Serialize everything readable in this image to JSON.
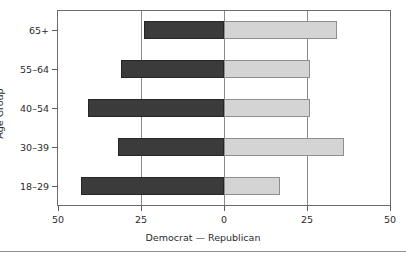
{
  "chart_data": {
    "type": "bar",
    "title": "",
    "subtitle": "",
    "orientation": "horizontal",
    "style": "diverging-population-pyramid",
    "xlabel": "Democrat  —  Republican",
    "ylabel": "Age Group",
    "categories": [
      "18–29",
      "30–39",
      "40–54",
      "55–64",
      "65+"
    ],
    "category_order_top_to_bottom": [
      "65+",
      "55–64",
      "40–54",
      "30–39",
      "18–29"
    ],
    "series": [
      {
        "name": "Democrat",
        "side": "left",
        "color": "#3b3b3b",
        "values": [
          43,
          32,
          41,
          31,
          24
        ]
      },
      {
        "name": "Republican",
        "side": "right",
        "color": "#d4d4d4",
        "values": [
          17,
          36,
          26,
          26,
          34
        ]
      }
    ],
    "xlim": [
      -50,
      50
    ],
    "xticks": [
      -50,
      -25,
      0,
      25,
      50
    ],
    "xtick_labels": [
      "50",
      "25",
      "0",
      "25",
      "50"
    ],
    "grid": true,
    "gridlines_at": [
      -25,
      0,
      25
    ],
    "legend": "none",
    "axis_color": "#6b6b6b"
  },
  "axis": {
    "ylabel": "Age Group",
    "xlabel": "Democrat  —  Republican",
    "xticks": [
      {
        "label": "50",
        "value": -50
      },
      {
        "label": "25",
        "value": -25
      },
      {
        "label": "0",
        "value": 0
      },
      {
        "label": "25",
        "value": 25
      },
      {
        "label": "50",
        "value": 50
      }
    ],
    "yticks": [
      {
        "label": "65+"
      },
      {
        "label": "55–64"
      },
      {
        "label": "40–54"
      },
      {
        "label": "30–39"
      },
      {
        "label": "18–29"
      }
    ]
  }
}
